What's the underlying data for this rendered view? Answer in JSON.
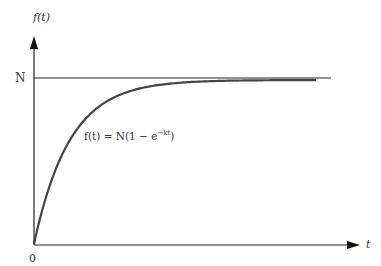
{
  "chart_data": {
    "type": "line",
    "title": "",
    "xlabel": "t",
    "ylabel": "f(t)",
    "series": [
      {
        "name": "f(t) = N(1 − e^(−kt))",
        "formula": "N(1 - e^(-k t))"
      },
      {
        "name": "N (asymptote)",
        "constant": "N"
      }
    ],
    "annotations": [
      "f(t) = N(1 − e^{−kt})"
    ],
    "y_tick_labels": [
      "N"
    ],
    "x_tick_labels": [
      "0"
    ],
    "grid": false,
    "legend": "none"
  },
  "labels": {
    "y_axis": "f(t)",
    "x_axis": "t",
    "origin": "0",
    "asymptote": "N",
    "equation_main": "f(t)  =  N(1 − e",
    "equation_exp": "−kt",
    "equation_close": ")"
  }
}
